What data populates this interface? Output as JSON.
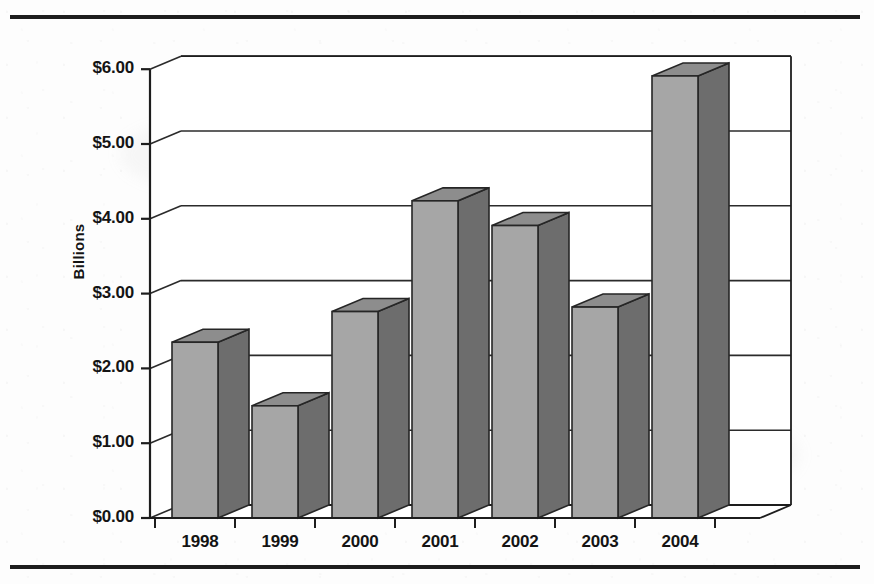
{
  "page": {
    "background_color": "#fdfdfd",
    "rule_color": "#1d1d1d"
  },
  "chart_data": {
    "type": "bar",
    "style": "3d-column",
    "title": "",
    "subtitle": "",
    "xlabel": "",
    "ylabel": "Billions",
    "categories": [
      "1998",
      "1999",
      "2000",
      "2001",
      "2002",
      "2003",
      "2004"
    ],
    "values": [
      2.35,
      1.5,
      2.76,
      4.24,
      3.91,
      2.82,
      5.91
    ],
    "series": [
      {
        "name": "",
        "values": [
          2.35,
          1.5,
          2.76,
          4.24,
          3.91,
          2.82,
          5.91
        ]
      }
    ],
    "ylim": [
      0,
      6
    ],
    "ytick_values": [
      0,
      1,
      2,
      3,
      4,
      5,
      6
    ],
    "ytick_labels": [
      "$0.00",
      "$1.00",
      "$2.00",
      "$3.00",
      "$4.00",
      "$5.00",
      "$6.00"
    ],
    "xtick_labels": [
      "1998",
      "1999",
      "2000",
      "2001",
      "2002",
      "2003",
      "2004"
    ],
    "grid": true,
    "grid_axis": "y",
    "legend": false,
    "legend_position": "none",
    "annotations": [],
    "colors": {
      "bar_front": "#a6a6a6",
      "bar_side": "#6d6d6d",
      "bar_top": "#8d8d8d",
      "bar_outline": "#262626",
      "gridline": "#2b2b2b",
      "axis": "#1d1d1d",
      "text": "#141414",
      "plot_background": "#ffffff"
    }
  },
  "geometry": {
    "origin_x": 150,
    "origin_y": 518,
    "plot_width": 610,
    "px_per_unit": 74.8,
    "depth_dx": 31,
    "depth_dy": 13,
    "bar_width": 46,
    "slot_width": 80,
    "first_slot_center": 195
  }
}
